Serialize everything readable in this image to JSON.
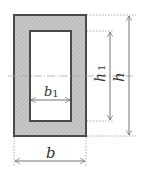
{
  "diagram": {
    "colors": {
      "hatch_fill": "#c8c8c8",
      "hatch_line": "#9a9a9a",
      "outline": "#4a4a4a",
      "dimension": "#666666",
      "extension": "#999999",
      "centerline": "#aaaaaa"
    },
    "outer": {
      "x": 14,
      "y": 15,
      "width": 72,
      "height": 121
    },
    "inner": {
      "x": 30,
      "y": 31,
      "width": 41,
      "height": 90
    },
    "dimensions": {
      "b": {
        "label": "b",
        "sub": ""
      },
      "b1": {
        "label": "b",
        "sub": "1"
      },
      "h": {
        "label": "h",
        "sub": ""
      },
      "h1": {
        "label": "h",
        "sub": "1"
      }
    }
  }
}
